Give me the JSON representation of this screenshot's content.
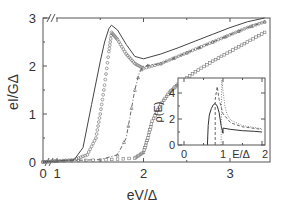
{
  "chart_data": [
    {
      "type": "line",
      "title": "",
      "xlabel": "eV/Δ",
      "ylabel": "eI/GΔ",
      "xlim": [
        0,
        3.45
      ],
      "ylim": [
        0,
        3
      ],
      "x_ticks": [
        "0",
        "1",
        "2",
        "3"
      ],
      "y_ticks": [
        "0",
        "1",
        "2",
        "3"
      ],
      "axis_break_x": "between 0 and 1",
      "axis_break_top": "//",
      "grid": false,
      "legend": null,
      "series": [
        {
          "name": "solid",
          "style": "solid line",
          "x": [
            0,
            1.0,
            1.2,
            1.3,
            1.4,
            1.5,
            1.55,
            1.6,
            1.63,
            1.7,
            1.8,
            1.9,
            2.0,
            2.2,
            2.4,
            2.6,
            2.8,
            3.0,
            3.2,
            3.4
          ],
          "y": [
            0,
            0.02,
            0.05,
            0.3,
            1.2,
            2.1,
            2.5,
            2.78,
            2.85,
            2.75,
            2.45,
            2.2,
            2.15,
            2.25,
            2.38,
            2.52,
            2.66,
            2.8,
            2.92,
            3.0
          ]
        },
        {
          "name": "circles",
          "style": "open circle markers",
          "x": [
            0,
            1.0,
            1.2,
            1.35,
            1.45,
            1.5,
            1.55,
            1.6,
            1.63,
            1.7,
            1.8,
            1.9,
            2.0,
            2.2,
            2.4,
            2.6,
            2.8,
            3.0,
            3.2,
            3.4
          ],
          "y": [
            0,
            0.02,
            0.05,
            0.15,
            0.5,
            1.0,
            1.6,
            2.3,
            2.7,
            2.55,
            2.25,
            2.05,
            1.95,
            2.05,
            2.2,
            2.35,
            2.5,
            2.65,
            2.8,
            2.92
          ]
        },
        {
          "name": "dash-dot",
          "style": "dash-dot line with triangle markers",
          "x": [
            0,
            1.0,
            1.5,
            1.7,
            1.8,
            1.85,
            1.9,
            1.95,
            2.0,
            2.2,
            2.4,
            2.6,
            2.8,
            3.0,
            3.2,
            3.4
          ],
          "y": [
            0,
            0.02,
            0.05,
            0.15,
            0.5,
            1.0,
            1.5,
            1.85,
            2.0,
            2.05,
            2.2,
            2.35,
            2.5,
            2.65,
            2.8,
            2.92
          ]
        },
        {
          "name": "squares",
          "style": "open square markers",
          "x": [
            0,
            1.0,
            1.5,
            1.9,
            2.0,
            2.05,
            2.1,
            2.2,
            2.3,
            2.4,
            2.6,
            2.8,
            3.0,
            3.2,
            3.4
          ],
          "y": [
            0,
            0.02,
            0.04,
            0.08,
            0.2,
            0.5,
            0.85,
            1.2,
            1.45,
            1.62,
            1.88,
            2.1,
            2.3,
            2.5,
            2.7
          ]
        }
      ]
    },
    {
      "type": "line",
      "title": "inset",
      "xlabel": "E/Δ",
      "ylabel": "ρ(E)",
      "xlim": [
        0,
        2
      ],
      "ylim": [
        0,
        5
      ],
      "x_ticks": [
        "0",
        "1",
        "2"
      ],
      "y_ticks": [
        "0",
        "2",
        "4"
      ],
      "series": [
        {
          "name": "solid",
          "style": "solid line",
          "x": [
            0.6,
            0.62,
            0.65,
            0.7,
            0.75,
            0.8,
            0.85,
            0.9,
            0.95,
            1.0,
            1.0,
            1.2,
            1.5,
            1.8,
            2.0
          ],
          "y": [
            0,
            1.5,
            2.3,
            2.8,
            3.1,
            3.2,
            3.0,
            2.5,
            1.5,
            0.9,
            1.3,
            1.2,
            1.1,
            1.05,
            1.0
          ]
        },
        {
          "name": "dashed",
          "style": "dashed line",
          "x": [
            0.8,
            0.8,
            0.85,
            0.9,
            1.0,
            1.2,
            1.5,
            2.0
          ],
          "y": [
            0,
            3.5,
            4.5,
            3.5,
            2.4,
            1.7,
            1.4,
            1.2
          ]
        },
        {
          "name": "dotted",
          "style": "dotted line",
          "x": [
            0.95,
            0.97,
            1.0,
            1.05,
            1.1,
            1.2,
            1.5,
            2.0
          ],
          "y": [
            0,
            5.0,
            4.2,
            3.0,
            2.4,
            1.9,
            1.5,
            1.25
          ]
        }
      ]
    }
  ],
  "labels": {
    "ylabel": "eI/GΔ",
    "xlabel": "eV/Δ",
    "break_mark": "//",
    "x_ticks": [
      "0",
      "1",
      "2",
      "3"
    ],
    "y_ticks": [
      "0",
      "1",
      "2",
      "3"
    ],
    "inset_ylabel": "ρ(E)",
    "inset_xlabel": "E/Δ",
    "inset_x_ticks": [
      "0",
      "1",
      "2"
    ],
    "inset_y_ticks": [
      "0",
      "2",
      "4"
    ]
  }
}
